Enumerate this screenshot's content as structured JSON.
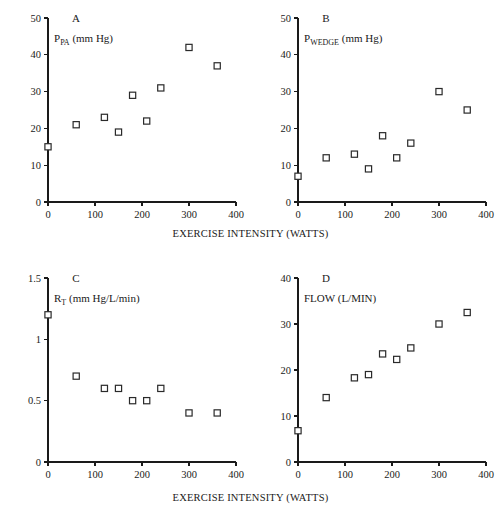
{
  "figure": {
    "title": "",
    "xlabel_top": "EXERCISE INTENSITY (WATTS)",
    "xlabel_bottom": "EXERCISE INTENSITY (WATTS)"
  },
  "chart_data": [
    {
      "type": "scatter",
      "panel": "A",
      "title": "",
      "series_label_main": "P",
      "series_label_sub": "PA",
      "series_label_unit": "(mm Hg)",
      "ylabel": "P_PA (mm Hg)",
      "xlabel": "EXERCISE INTENSITY (WATTS)",
      "xlim": [
        0,
        400
      ],
      "ylim": [
        0,
        50
      ],
      "xticks": [
        0,
        100,
        200,
        300,
        400
      ],
      "xtick_labels": [
        "0",
        "100",
        "200",
        "300",
        "400"
      ],
      "yticks": [
        0,
        10,
        20,
        30,
        40,
        50
      ],
      "ytick_labels": [
        "0",
        "10",
        "20",
        "30",
        "40",
        "50"
      ],
      "grid": false,
      "marker": "open-square",
      "x": [
        0,
        60,
        120,
        150,
        180,
        210,
        240,
        300,
        360
      ],
      "y": [
        15,
        21,
        23,
        19,
        29,
        22,
        31,
        42,
        37
      ]
    },
    {
      "type": "scatter",
      "panel": "B",
      "title": "",
      "series_label_main": "P",
      "series_label_sub": "WEDGE",
      "series_label_unit": "(mm Hg)",
      "ylabel": "P_WEDGE (mm Hg)",
      "xlabel": "EXERCISE INTENSITY (WATTS)",
      "xlim": [
        0,
        400
      ],
      "ylim": [
        0,
        50
      ],
      "xticks": [
        0,
        100,
        200,
        300,
        400
      ],
      "xtick_labels": [
        "0",
        "100",
        "200",
        "300",
        "400"
      ],
      "yticks": [
        0,
        10,
        20,
        30,
        40,
        50
      ],
      "ytick_labels": [
        "0",
        "10",
        "20",
        "30",
        "40",
        "50"
      ],
      "grid": false,
      "marker": "open-square",
      "x": [
        0,
        60,
        120,
        150,
        180,
        210,
        240,
        300,
        360
      ],
      "y": [
        7,
        12,
        13,
        9,
        18,
        12,
        16,
        30,
        25
      ]
    },
    {
      "type": "scatter",
      "panel": "C",
      "title": "",
      "series_label_main": "R",
      "series_label_sub": "T",
      "series_label_unit": "(mm Hg/L/min)",
      "ylabel": "R_T (mm Hg/L/min)",
      "xlabel": "EXERCISE INTENSITY (WATTS)",
      "xlim": [
        0,
        400
      ],
      "ylim": [
        0,
        1.5
      ],
      "xticks": [
        0,
        100,
        200,
        300,
        400
      ],
      "xtick_labels": [
        "0",
        "100",
        "200",
        "300",
        "400"
      ],
      "yticks": [
        0,
        0.5,
        1,
        1.5
      ],
      "ytick_labels": [
        "0",
        "0.5",
        "1",
        "1.5"
      ],
      "grid": false,
      "marker": "open-square",
      "x": [
        0,
        60,
        120,
        150,
        180,
        210,
        240,
        300,
        360
      ],
      "y": [
        1.2,
        0.7,
        0.6,
        0.6,
        0.5,
        0.5,
        0.6,
        0.4,
        0.4
      ]
    },
    {
      "type": "scatter",
      "panel": "D",
      "title": "",
      "series_label_main": "FLOW (L/MIN)",
      "series_label_sub": "",
      "series_label_unit": "",
      "ylabel": "FLOW (L/MIN)",
      "xlabel": "EXERCISE INTENSITY (WATTS)",
      "xlim": [
        0,
        400
      ],
      "ylim": [
        0,
        40
      ],
      "xticks": [
        0,
        100,
        200,
        300,
        400
      ],
      "xtick_labels": [
        "0",
        "100",
        "200",
        "300",
        "400"
      ],
      "yticks": [
        0,
        10,
        20,
        30,
        40
      ],
      "ytick_labels": [
        "0",
        "10",
        "20",
        "30",
        "40"
      ],
      "grid": false,
      "marker": "open-square",
      "x": [
        0,
        60,
        120,
        150,
        180,
        210,
        240,
        300,
        360
      ],
      "y": [
        6.8,
        14,
        18.3,
        19,
        23.5,
        22.3,
        24.8,
        30,
        32.5
      ]
    }
  ]
}
